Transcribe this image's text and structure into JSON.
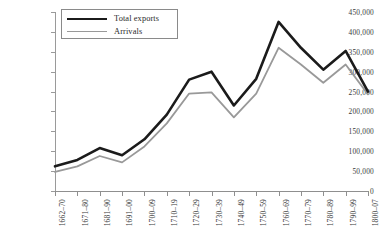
{
  "chart_data": {
    "type": "line",
    "title": "",
    "xlabel": "",
    "ylabel": "",
    "ylim": [
      0,
      450000
    ],
    "ytick_step": 50000,
    "grid": false,
    "legend_position": "top-left-inside",
    "categories": [
      "1662–70",
      "1671–80",
      "1681–90",
      "1691–00",
      "1700–09",
      "1710–19",
      "1720–29",
      "1730–39",
      "1740–49",
      "1750–59",
      "1760–69",
      "1770–79",
      "1780–89",
      "1790–99",
      "1800–07"
    ],
    "ytick_labels": [
      "0",
      "50,000",
      "100,000",
      "150,000",
      "200,000",
      "250,000",
      "300,000",
      "350,000",
      "400,000",
      "450,000"
    ],
    "ytick_values": [
      0,
      50000,
      100000,
      150000,
      200000,
      250000,
      300000,
      350000,
      400000,
      450000
    ],
    "series": [
      {
        "name": "Total exports",
        "color": "#1b1b1b",
        "line_width": 2.6,
        "values": [
          62000,
          78000,
          108000,
          90000,
          130000,
          192000,
          280000,
          300000,
          215000,
          282000,
          425000,
          360000,
          305000,
          352000,
          250000
        ]
      },
      {
        "name": "Arrivals",
        "color": "#999999",
        "line_width": 1.8,
        "values": [
          48000,
          62000,
          88000,
          72000,
          112000,
          170000,
          245000,
          248000,
          185000,
          245000,
          360000,
          318000,
          272000,
          318000,
          243000
        ]
      }
    ]
  },
  "legend": {
    "entries": [
      {
        "label": "Total exports"
      },
      {
        "label": "Arrivals"
      }
    ]
  },
  "colors": {
    "total_exports": "#1b1b1b",
    "arrivals": "#999999",
    "axis": "#8f8f8f",
    "text": "#2b2b2b",
    "background": "#ffffff"
  }
}
